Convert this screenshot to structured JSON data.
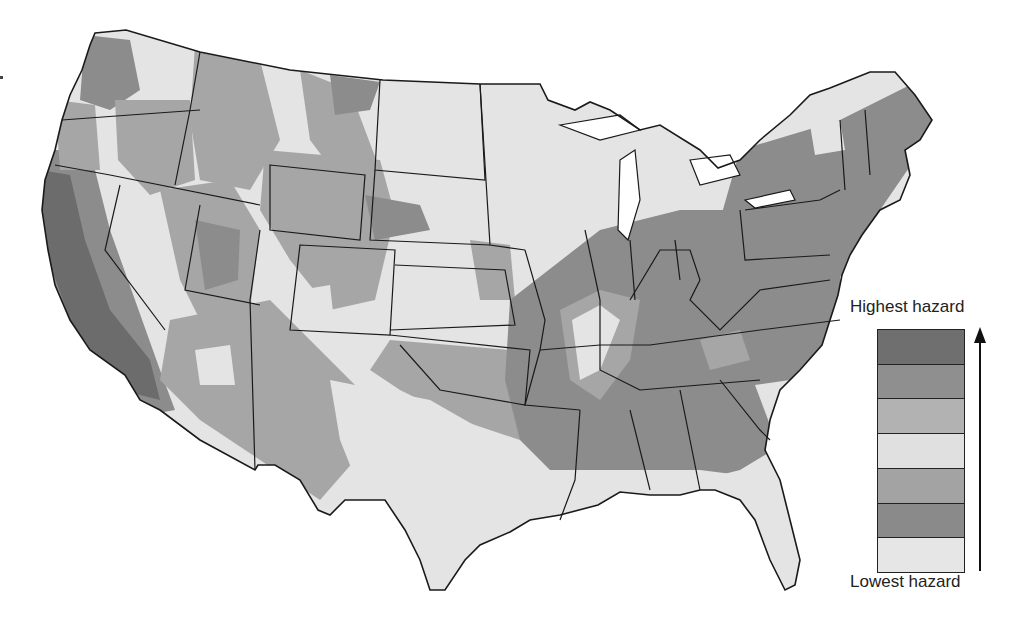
{
  "map": {
    "title": "",
    "subject": "Seismic hazard, conterminous United States",
    "legend": {
      "top_label": "Highest hazard",
      "bottom_label": "Lowest hazard",
      "direction": "arrow pointing up from lowest to highest",
      "bands": [
        {
          "rank": 7,
          "level": "highest",
          "color": "#6f6f6f"
        },
        {
          "rank": 6,
          "color": "#8f8f8f"
        },
        {
          "rank": 5,
          "color": "#b2b2b2"
        },
        {
          "rank": 4,
          "color": "#e0e0e0"
        },
        {
          "rank": 3,
          "color": "#a3a3a3"
        },
        {
          "rank": 2,
          "color": "#8a8a8a"
        },
        {
          "rank": 1,
          "level": "lowest",
          "color": "#e6e6e6"
        }
      ]
    },
    "colors": {
      "background": "#ffffff",
      "outline": "#1a1a1a",
      "low": "#e4e4e4",
      "mid": "#a6a6a6",
      "high": "#8c8c8c",
      "highest": "#6c6c6c"
    }
  }
}
